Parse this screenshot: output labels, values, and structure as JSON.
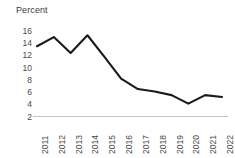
{
  "chart_data": {
    "type": "line",
    "title": "",
    "subtitle": "",
    "xlabel": "",
    "ylabel": "Percent",
    "categories": [
      "2011",
      "2012",
      "2013",
      "2014",
      "2015",
      "2016",
      "2017",
      "2018",
      "2019",
      "2020",
      "2021",
      "2022"
    ],
    "values": [
      13.5,
      15.0,
      12.4,
      15.3,
      11.8,
      8.2,
      6.5,
      6.1,
      5.5,
      4.1,
      5.5,
      5.2
    ],
    "series": [
      {
        "name": "Percent",
        "values": [
          13.5,
          15.0,
          12.4,
          15.3,
          11.8,
          8.2,
          6.5,
          6.1,
          5.5,
          4.1,
          5.5,
          5.2
        ]
      }
    ],
    "ylim": [
      2,
      16
    ],
    "yticks": [
      16,
      14,
      12,
      10,
      8,
      6,
      4,
      2
    ],
    "ytick_labels": [
      "16",
      "14",
      "12",
      "10",
      "8",
      "6",
      "4",
      "2"
    ],
    "xtick_labels": [
      "2011",
      "2012",
      "2013",
      "2014",
      "2015",
      "2016",
      "2017",
      "2018",
      "2019",
      "2020",
      "2021",
      "2022"
    ],
    "xtick_rotation": -90,
    "grid": false,
    "legend": false,
    "legend_position": "none",
    "annotations": [],
    "line_color": "#1a1a1a",
    "axis_color": "#bfbfbf",
    "tick_text_color": "#4a4a4a",
    "markers": false
  },
  "axis": {
    "ylabel": "Percent"
  }
}
